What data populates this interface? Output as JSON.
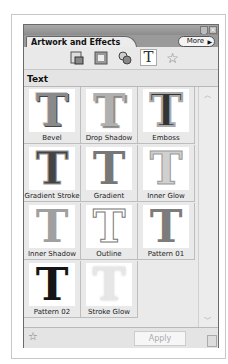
{
  "panel": {
    "tab_title": "Artwork and Effects",
    "more_label": "More",
    "section_title": "Text",
    "toolbar_icons": [
      "artwork-icon",
      "frames-icon",
      "effects-icon",
      "text-icon",
      "favorites-icon"
    ],
    "active_toolbar_icon": "text-icon"
  },
  "effects": [
    {
      "label": "Bevel",
      "color": "#7a7a7a",
      "style": "bevel"
    },
    {
      "label": "Drop Shadow",
      "color": "#a8a8a8",
      "style": "shadow"
    },
    {
      "label": "Emboss",
      "color": "#2e2e2e",
      "style": "emboss"
    },
    {
      "label": "Gradient Stroke",
      "color": "#3a3a3a",
      "style": "gstroke"
    },
    {
      "label": "Gradient",
      "color": "#6e6e6e",
      "style": "gradient"
    },
    {
      "label": "Inner Glow",
      "color": "#c4c4c4",
      "style": "glow"
    },
    {
      "label": "Inner Shadow",
      "color": "#9c9c9c",
      "style": "inner"
    },
    {
      "label": "Outline",
      "color": "#ffffff",
      "style": "outline"
    },
    {
      "label": "Pattern 01",
      "color": "#7c7c7c",
      "style": "pattern"
    },
    {
      "label": "Pattern 02",
      "color": "#141414",
      "style": "pattern2"
    },
    {
      "label": "Stroke Glow",
      "color": "#e2e2e2",
      "style": "sglow"
    }
  ],
  "footer": {
    "apply_label": "Apply"
  }
}
